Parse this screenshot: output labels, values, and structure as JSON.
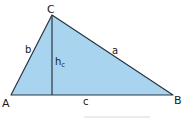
{
  "diagram": {
    "type": "triangle-with-altitude",
    "colors": {
      "fill": "#a9d4f0",
      "stroke": "#2a3440",
      "text": "#1a1a1a",
      "underline": "#d8d8d8"
    },
    "vertices": {
      "A": {
        "label": "A",
        "x": 11,
        "y": 95
      },
      "B": {
        "label": "B",
        "x": 173,
        "y": 95
      },
      "C": {
        "label": "C",
        "x": 52,
        "y": 15
      }
    },
    "sides": {
      "a": {
        "label": "a"
      },
      "b": {
        "label": "b"
      },
      "c": {
        "label": "c"
      }
    },
    "altitude": {
      "label": "h",
      "subscript": "c",
      "from": "C",
      "foot_x": 52,
      "foot_y": 95
    }
  }
}
